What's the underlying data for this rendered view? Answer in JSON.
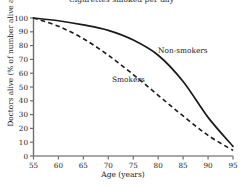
{
  "chart_data": {
    "type": "line",
    "title": "Cigarettes smoked per day",
    "xlabel": "Age (years)",
    "ylabel": "Doctors alive (% of number alive at age 55)",
    "xlim": [
      55,
      95
    ],
    "ylim": [
      0,
      100
    ],
    "xticks": [
      55,
      60,
      65,
      70,
      75,
      80,
      85,
      90,
      95
    ],
    "yticks": [
      0,
      10,
      20,
      30,
      40,
      50,
      60,
      70,
      80,
      90,
      100
    ],
    "grid": false,
    "legend_position": "inline-annotation",
    "x": [
      55,
      60,
      65,
      70,
      75,
      80,
      85,
      90,
      95
    ],
    "series": [
      {
        "name": "Non-smokers",
        "style": "solid",
        "color": "#1a1a1a",
        "values": [
          100,
          98,
          95,
          91,
          84,
          73,
          54,
          28,
          7
        ],
        "annotation": "Non-smokers"
      },
      {
        "name": "Smokers",
        "style": "dashed",
        "color": "#1a1a1a",
        "values": [
          100,
          94,
          85,
          73,
          59,
          44,
          29,
          15,
          4
        ],
        "annotation": "Smokers"
      }
    ]
  },
  "annotations": {
    "non_smokers_label": "Non-smokers",
    "smokers_label": "Smokers"
  },
  "axis": {
    "x_tick_labels": [
      "55",
      "60",
      "65",
      "70",
      "75",
      "80",
      "85",
      "90",
      "95"
    ],
    "y_tick_labels": [
      "0",
      "10",
      "20",
      "30",
      "40",
      "50",
      "60",
      "70",
      "80",
      "90",
      "100"
    ]
  },
  "colors": {
    "axis": "#6e6e6e",
    "line": "#1a1a1a",
    "background": "#ffffff",
    "text": "#1a1a1a"
  }
}
